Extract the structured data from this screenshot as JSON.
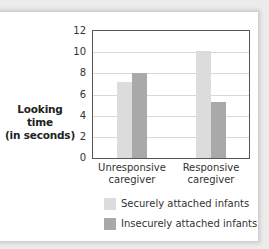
{
  "chart_data": {
    "type": "bar",
    "title": "",
    "xlabel": "",
    "ylabel": "Looking time (in seconds)",
    "ylabel_lines": [
      "Looking time",
      "(in seconds)"
    ],
    "ylim": [
      0,
      12
    ],
    "yticks": [
      "0",
      "2",
      "4",
      "6",
      "8",
      "10",
      "12"
    ],
    "grid": true,
    "categories": [
      "Unresponsive caregiver",
      "Responsive caregiver"
    ],
    "category_lines": [
      [
        "Unresponsive",
        "caregiver"
      ],
      [
        "Responsive",
        "caregiver"
      ]
    ],
    "series": [
      {
        "name": "Securely attached infants",
        "values": [
          7.2,
          10.1
        ],
        "color": "#dcdcdc"
      },
      {
        "name": "Insecurely attached infants",
        "values": [
          8.0,
          5.3
        ],
        "color": "#a9a9a9"
      }
    ],
    "legend_position": "bottom"
  }
}
